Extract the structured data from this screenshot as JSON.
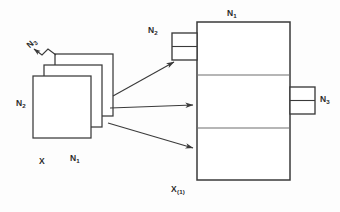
{
  "diagram": {
    "title_visible": false,
    "background_color": "#fdfdfd",
    "stroke_color": "#3a3a3a",
    "text_color": "#2b2b2b",
    "labels": {
      "stack_n3": "N",
      "stack_n3_sub": "3",
      "stack_n2": "N",
      "stack_n2_sub": "2",
      "stack_x": "X",
      "stack_n1": "N",
      "stack_n1_sub": "1",
      "block_n1_top": "N",
      "block_n1_top_sub": "1",
      "tab_left_n2": "N",
      "tab_left_n2_sub": "2",
      "tab_right_n3": "N",
      "tab_right_n3_sub": "3",
      "block_x1_bottom": "X",
      "block_x1_bottom_sub": "(1)"
    },
    "stack": {
      "count": 3,
      "offset_x": 11,
      "offset_y": -11,
      "width": 58,
      "height": 62
    },
    "block": {
      "bands": 3,
      "x": 197,
      "y": 22,
      "width": 93,
      "height": 158
    },
    "tabs": {
      "left_cells": 2,
      "right_cells": 2
    },
    "arrows": {
      "count": 3
    }
  }
}
